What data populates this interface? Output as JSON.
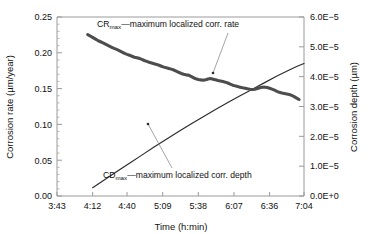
{
  "chart_data": {
    "type": "line",
    "title": "",
    "xlabel": "Time (h:min)",
    "ylabel": "Corrosion rate (µm/year)",
    "y2label": "Corrosion depth (µm)",
    "grid": false,
    "legend_position": "inline-annotations",
    "x_tick_labels": [
      "3:43",
      "4:12",
      "4:40",
      "5:09",
      "5:38",
      "6:07",
      "6:36",
      "7:04"
    ],
    "x_tick_minutes": [
      223,
      252,
      280,
      309,
      338,
      367,
      396,
      424
    ],
    "xlim_minutes": [
      223,
      424
    ],
    "y_tick_labels": [
      "0.00",
      "0.05",
      "0.10",
      "0.15",
      "0.20",
      "0.25"
    ],
    "y_tick_values": [
      0.0,
      0.05,
      0.1,
      0.15,
      0.2,
      0.25
    ],
    "ylim": [
      0.0,
      0.25
    ],
    "y2_tick_labels": [
      "0.0E+0",
      "1.0E−5",
      "2.0E−5",
      "3.0E−5",
      "4.0E−5",
      "5.0E−5",
      "6.0E−5"
    ],
    "y2_tick_values": [
      0.0,
      1e-05,
      2e-05,
      3e-05,
      4e-05,
      5e-05,
      6e-05
    ],
    "y2lim": [
      0.0,
      6e-05
    ],
    "annotations": [
      {
        "id": "cr-annotation",
        "prefix": "CR",
        "subscript": "max",
        "text": "—maximum localized corr. rate",
        "full_text": "CRmax—maximum localized corr. rate"
      },
      {
        "id": "cd-annotation",
        "prefix": "CD",
        "subscript": "max",
        "text": "—maximum localized corr. depth",
        "full_text": "CDmax—maximum localized corr. depth"
      }
    ],
    "series": [
      {
        "name": "CRmax—maximum localized corr. rate",
        "axis": "left",
        "units": "µm/year",
        "style": "thick-gray-line",
        "color": "#4d4d4d",
        "x": [
          248,
          250,
          252,
          254,
          256,
          258,
          260,
          262,
          264,
          266,
          268,
          270,
          272,
          274,
          276,
          278,
          280,
          282,
          284,
          286,
          288,
          290,
          292,
          294,
          296,
          298,
          300,
          302,
          304,
          306,
          308,
          310,
          312,
          314,
          316,
          318,
          320,
          322,
          324,
          326,
          328,
          330,
          332,
          334,
          336,
          338,
          340,
          342,
          344,
          346,
          348,
          350,
          352,
          354,
          356,
          358,
          360,
          362,
          364,
          366,
          368,
          370,
          372,
          374,
          376,
          378,
          380,
          382,
          384,
          386,
          388,
          390,
          392,
          394,
          396,
          398,
          400,
          402,
          404,
          406,
          408
        ],
        "values": [
          0.2255,
          0.2235,
          0.2215,
          0.2195,
          0.2175,
          0.2158,
          0.2142,
          0.2125,
          0.2108,
          0.209,
          0.2072,
          0.2058,
          0.2045,
          0.2028,
          0.201,
          0.1992,
          0.1978,
          0.1965,
          0.1952,
          0.1938,
          0.193,
          0.1922,
          0.1908,
          0.1892,
          0.188,
          0.1868,
          0.1858,
          0.1848,
          0.1838,
          0.1826,
          0.1812,
          0.18,
          0.179,
          0.1782,
          0.1772,
          0.176,
          0.1745,
          0.1728,
          0.1712,
          0.17,
          0.1692,
          0.1688,
          0.167,
          0.1652,
          0.1638,
          0.1628,
          0.1622,
          0.1618,
          0.1625,
          0.1635,
          0.164,
          0.1632,
          0.1622,
          0.1612,
          0.1605,
          0.1598,
          0.159,
          0.1578,
          0.1562,
          0.1548,
          0.1538,
          0.1528,
          0.152,
          0.1512,
          0.1505,
          0.1498,
          0.1492,
          0.1488,
          0.1492,
          0.1502,
          0.1512,
          0.1518,
          0.152,
          0.1516,
          0.1505,
          0.1492,
          0.1478,
          0.1462,
          0.1448,
          0.1438,
          0.1432
        ],
        "x_tail": [
          410,
          412,
          414,
          416,
          418,
          420
        ],
        "values_tail": [
          0.1425,
          0.1418,
          0.1405,
          0.1388,
          0.1368,
          0.1348
        ]
      },
      {
        "name": "CDmax—maximum localized corr. depth",
        "axis": "right",
        "units": "µm",
        "style": "thin-black-line",
        "color": "#2b2b2b",
        "x": [
          252,
          262,
          272,
          282,
          292,
          302,
          312,
          322,
          332,
          342,
          352,
          362,
          372,
          382,
          392,
          402,
          412,
          418
        ],
        "values": [
          2.8e-06,
          5.5e-06,
          8.3e-06,
          1.1e-05,
          1.37e-05,
          1.64e-05,
          1.9e-05,
          2.16e-05,
          2.41e-05,
          2.66e-05,
          2.9e-05,
          3.13e-05,
          3.36e-05,
          3.58e-05,
          3.8e-05,
          4.02e-05,
          4.22e-05,
          4.34e-05
        ],
        "x_tail": [
          424,
          430,
          436,
          442,
          448,
          454,
          460
        ],
        "values_tail": [
          4.44e-05,
          4.55e-05,
          4.64e-05,
          4.72e-05,
          4.79e-05,
          4.85e-05,
          4.9e-05
        ]
      }
    ]
  }
}
